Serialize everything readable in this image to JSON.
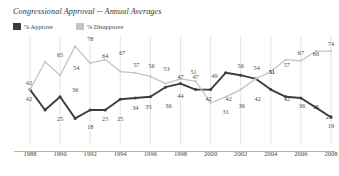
{
  "title": "Congressional Approval -- Annual Averages",
  "legend": {
    "items": [
      {
        "label": "% Approve",
        "color": "#3d3d3d",
        "swatch": "approve-swatch"
      },
      {
        "label": "% Disapprove",
        "color": "#c4c4c4",
        "swatch": "disapprove-swatch"
      }
    ]
  },
  "colors": {
    "approve": "#3d3d3d",
    "disapprove": "#c4c4c4",
    "gridline": "#d8d8d8",
    "axis": "#9a9a9a",
    "text": "#4a4a4a"
  },
  "chart_data": {
    "type": "line",
    "title": "Congressional Approval -- Annual Averages",
    "xlabel": "",
    "ylabel": "",
    "ylim": [
      0,
      85
    ],
    "grid": "vertical-only",
    "legend_position": "top-left",
    "x": [
      1988,
      1989,
      1990,
      1991,
      1992,
      1993,
      1994,
      1995,
      1996,
      1997,
      1998,
      1999,
      2000,
      2001,
      2002,
      2003,
      2004,
      2005,
      2006,
      2007,
      2008
    ],
    "tick_labels": [
      "1988",
      "1990",
      "1992",
      "1994",
      "1996",
      "1998",
      "2000",
      "2002",
      "2004",
      "2006",
      "2008"
    ],
    "tick_years": [
      1988,
      1990,
      1992,
      1994,
      1996,
      1998,
      2000,
      2002,
      2004,
      2006,
      2008
    ],
    "series": [
      {
        "name": "% Approve",
        "color": "#3d3d3d",
        "values": [
          42,
          25,
          36,
          18,
          25,
          25,
          34,
          35,
          36,
          44,
          47,
          42,
          42,
          56,
          54,
          51,
          42,
          36,
          35,
          27,
          19
        ]
      },
      {
        "name": "% Disapprove",
        "color": "#c4c4c4",
        "values": [
          42,
          65,
          54,
          78,
          64,
          67,
          57,
          56,
          53,
          47,
          51,
          49,
          31,
          36,
          42,
          51,
          57,
          67,
          66,
          74,
          74
        ]
      }
    ],
    "point_labels": [
      {
        "series": "disapprove",
        "year": 1988,
        "value": 42,
        "dx": -1,
        "dy": -8
      },
      {
        "series": "disapprove",
        "year": 1990,
        "value": 65,
        "dx": 0,
        "dy": -8
      },
      {
        "series": "disapprove",
        "year": 1991,
        "value": 54,
        "dx": 1,
        "dy": -8
      },
      {
        "series": "disapprove",
        "year": 1992,
        "value": 78,
        "dx": 0,
        "dy": -8
      },
      {
        "series": "disapprove",
        "year": 1993,
        "value": 64,
        "dx": 0,
        "dy": -8
      },
      {
        "series": "disapprove",
        "year": 1994,
        "value": 67,
        "dx": 2,
        "dy": -8
      },
      {
        "series": "disapprove",
        "year": 1995,
        "value": 57,
        "dx": 1,
        "dy": -8
      },
      {
        "series": "disapprove",
        "year": 1996,
        "value": 56,
        "dx": 1,
        "dy": -8
      },
      {
        "series": "disapprove",
        "year": 1997,
        "value": 53,
        "dx": 1,
        "dy": -8
      },
      {
        "series": "disapprove",
        "year": 1998,
        "value": 47,
        "dx": 0,
        "dy": -8
      },
      {
        "series": "disapprove",
        "year": 1999,
        "value": 51,
        "dx": -2,
        "dy": -8
      },
      {
        "series": "disapprove",
        "year": 2000,
        "value": 49,
        "dx": 4,
        "dy": -6
      },
      {
        "series": "disapprove",
        "year": 2001,
        "value": 31,
        "dx": 0,
        "dy": 8
      },
      {
        "series": "disapprove",
        "year": 2002,
        "value": 36,
        "dx": 1,
        "dy": 8
      },
      {
        "series": "disapprove",
        "year": 2003,
        "value": 42,
        "dx": 2,
        "dy": 8
      },
      {
        "series": "disapprove",
        "year": 2004,
        "value": 51,
        "dx": 1,
        "dy": -8
      },
      {
        "series": "disapprove",
        "year": 2005,
        "value": 57,
        "dx": 1,
        "dy": -8
      },
      {
        "series": "disapprove",
        "year": 2006,
        "value": 67,
        "dx": 0,
        "dy": -8
      },
      {
        "series": "disapprove",
        "year": 2007,
        "value": 66,
        "dx": 0,
        "dy": -8
      },
      {
        "series": "disapprove",
        "year": 2008,
        "value": 74,
        "dx": 0,
        "dy": -8
      },
      {
        "series": "approve",
        "year": 1988,
        "value": 42,
        "dx": -1,
        "dy": 8
      },
      {
        "series": "approve",
        "year": 1990,
        "value": 25,
        "dx": 0,
        "dy": 8
      },
      {
        "series": "approve",
        "year": 1991,
        "value": 36,
        "dx": 0,
        "dy": -8
      },
      {
        "series": "approve",
        "year": 1992,
        "value": 18,
        "dx": 0,
        "dy": 8
      },
      {
        "series": "approve",
        "year": 1993,
        "value": 25,
        "dx": 0,
        "dy": 8
      },
      {
        "series": "approve",
        "year": 1994,
        "value": 25,
        "dx": 0,
        "dy": 8
      },
      {
        "series": "approve",
        "year": 1995,
        "value": 34,
        "dx": 0,
        "dy": 8
      },
      {
        "series": "approve",
        "year": 1996,
        "value": 35,
        "dx": -2,
        "dy": 8
      },
      {
        "series": "approve",
        "year": 1997,
        "value": 36,
        "dx": 3,
        "dy": 8
      },
      {
        "series": "approve",
        "year": 1998,
        "value": 44,
        "dx": 0,
        "dy": 8
      },
      {
        "series": "approve",
        "year": 1999,
        "value": 47,
        "dx": 0,
        "dy": -8
      },
      {
        "series": "approve",
        "year": 2000,
        "value": 42,
        "dx": -2,
        "dy": 8
      },
      {
        "series": "approve",
        "year": 2001,
        "value": 42,
        "dx": 3,
        "dy": 8
      },
      {
        "series": "approve",
        "year": 2002,
        "value": 56,
        "dx": 0,
        "dy": -8
      },
      {
        "series": "approve",
        "year": 2003,
        "value": 54,
        "dx": 1,
        "dy": -8
      },
      {
        "series": "approve",
        "year": 2004,
        "value": 51,
        "dx": 1,
        "dy": -8
      },
      {
        "series": "approve",
        "year": 2005,
        "value": 42,
        "dx": 1,
        "dy": 8
      },
      {
        "series": "approve",
        "year": 2006,
        "value": 36,
        "dx": 1,
        "dy": 8
      },
      {
        "series": "approve",
        "year": 2007,
        "value": 35,
        "dx": 0,
        "dy": 8
      },
      {
        "series": "approve",
        "year": 2008,
        "value": 27,
        "dx": -2,
        "dy": 8
      },
      {
        "series": "approve",
        "year": 2009,
        "value": 19,
        "dx": 0,
        "dy": 8
      }
    ]
  }
}
